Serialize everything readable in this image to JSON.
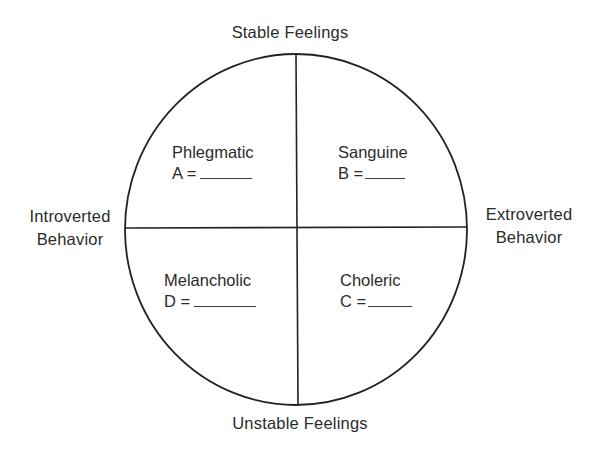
{
  "diagram": {
    "axes": {
      "top": "Stable Feelings",
      "bottom": "Unstable Feelings",
      "left_line1": "Introverted",
      "left_line2": "Behavior",
      "right_line1": "Extroverted",
      "right_line2": "Behavior"
    },
    "quadrants": [
      {
        "position": "top-left",
        "name": "Phlegmatic",
        "letter_prefix": "A =",
        "blank": ""
      },
      {
        "position": "top-right",
        "name": "Sanguine",
        "letter_prefix": "B =",
        "blank": ""
      },
      {
        "position": "bottom-left",
        "name": "Melancholic",
        "letter_prefix": "D =",
        "blank": ""
      },
      {
        "position": "bottom-right",
        "name": "Choleric",
        "letter_prefix": "C =",
        "blank": ""
      }
    ],
    "colors": {
      "line": "#222222",
      "text": "#2b2b2b",
      "background": "#ffffff"
    }
  }
}
